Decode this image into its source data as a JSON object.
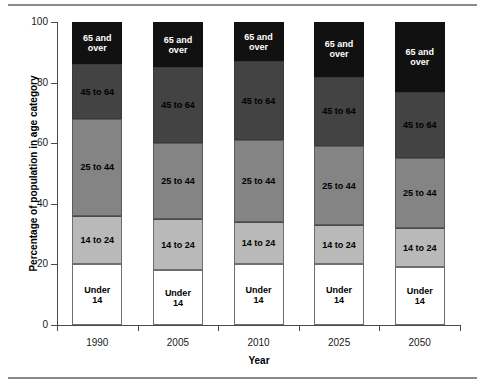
{
  "figure": {
    "has_top_rule": true,
    "has_bottom_rule": true,
    "rule_color": "#8a8a8a"
  },
  "axes": {
    "y_title": "Percentage of population in age category",
    "x_title": "Year",
    "y_ticks": [
      "0",
      "20",
      "40",
      "60",
      "80",
      "100"
    ],
    "x_ticks": [
      "1990",
      "2005",
      "2010",
      "2025",
      "2050"
    ]
  },
  "colors": {
    "under_14": "#ffffff",
    "age_14_to_24": "#b9b9b9",
    "age_25_to_44": "#848484",
    "age_45_to_64": "#434343",
    "age_65_and_over": "#111111",
    "axis": "#4a4a4a",
    "text": "#000000"
  },
  "labels": {
    "under_14": "Under\n14",
    "age_14_to_24": "14 to 24",
    "age_25_to_44": "25 to 44",
    "age_45_to_64": "45 to 64",
    "age_65_and_over": "65 and\nover"
  },
  "chart_data": {
    "type": "bar",
    "stacked": true,
    "title": "",
    "xlabel": "Year",
    "ylabel": "Percentage of population in age category",
    "ylim": [
      0,
      100
    ],
    "yticks": [
      0,
      20,
      40,
      60,
      80,
      100
    ],
    "grid": false,
    "legend": "in-segment labels",
    "categories": [
      "1990",
      "2005",
      "2010",
      "2025",
      "2050"
    ],
    "series": [
      {
        "name": "Under 14",
        "values": [
          20,
          18,
          20,
          20,
          19
        ]
      },
      {
        "name": "14 to 24",
        "values": [
          16,
          17,
          14,
          13,
          13
        ]
      },
      {
        "name": "25 to 44",
        "values": [
          32,
          25,
          27,
          26,
          23
        ]
      },
      {
        "name": "45 to 64",
        "values": [
          18,
          25,
          26,
          23,
          22
        ]
      },
      {
        "name": "65 and over",
        "values": [
          14,
          15,
          13,
          18,
          23
        ]
      }
    ],
    "cumulative_tops": {
      "1990": [
        20,
        36,
        68,
        86,
        100
      ],
      "2005": [
        18,
        35,
        60,
        85,
        100
      ],
      "2010": [
        20,
        34,
        61,
        87,
        100
      ],
      "2025": [
        20,
        33,
        59,
        82,
        100
      ],
      "2050": [
        19,
        32,
        55,
        77,
        100
      ]
    }
  }
}
